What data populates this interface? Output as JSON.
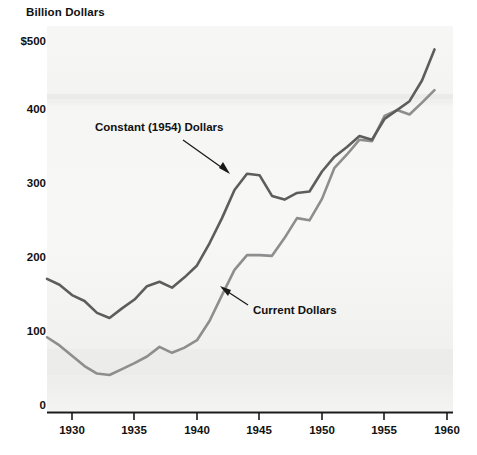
{
  "chart_data": {
    "type": "line",
    "title": "Billion Dollars",
    "xlabel": "",
    "ylabel": "Billion Dollars",
    "xlim": [
      1928,
      1960
    ],
    "ylim": [
      0,
      500
    ],
    "grid": false,
    "legend_position": "inline-annotations",
    "y_ticks": [
      {
        "label": "$500",
        "value": 500
      },
      {
        "label": "400",
        "value": 400
      },
      {
        "label": "300",
        "value": 300
      },
      {
        "label": "200",
        "value": 200
      },
      {
        "label": "100",
        "value": 100
      },
      {
        "label": "0",
        "value": 0
      }
    ],
    "x_ticks": [
      {
        "label": "1930",
        "value": 1930
      },
      {
        "label": "1935",
        "value": 1935
      },
      {
        "label": "1940",
        "value": 1940
      },
      {
        "label": "1945",
        "value": 1945
      },
      {
        "label": "1950",
        "value": 1950
      },
      {
        "label": "1955",
        "value": 1955
      },
      {
        "label": "1960",
        "value": 1960
      }
    ],
    "x": [
      1928,
      1929,
      1930,
      1931,
      1932,
      1933,
      1934,
      1935,
      1936,
      1937,
      1938,
      1939,
      1940,
      1941,
      1942,
      1943,
      1944,
      1945,
      1946,
      1947,
      1948,
      1949,
      1950,
      1951,
      1952,
      1953,
      1954,
      1955,
      1956,
      1957,
      1958,
      1959
    ],
    "series": [
      {
        "name": "Constant (1954) Dollars",
        "color": "#5d5d5d",
        "values": [
          180,
          172,
          158,
          150,
          134,
          127,
          140,
          152,
          170,
          176,
          168,
          182,
          198,
          228,
          262,
          300,
          322,
          320,
          292,
          287,
          296,
          298,
          325,
          345,
          358,
          373,
          368,
          396,
          408,
          420,
          448,
          490
        ]
      },
      {
        "name": "Current Dollars",
        "color": "#8e8e8e",
        "values": [
          101,
          90,
          76,
          62,
          52,
          50,
          58,
          66,
          75,
          88,
          80,
          87,
          97,
          123,
          158,
          192,
          212,
          212,
          211,
          235,
          262,
          259,
          288,
          330,
          348,
          368,
          366,
          400,
          408,
          402,
          418,
          435
        ]
      }
    ],
    "annotations": [
      {
        "text": "Constant (1954) Dollars",
        "target_series": "Constant (1954) Dollars"
      },
      {
        "text": "Current Dollars",
        "target_series": "Current Dollars"
      }
    ]
  }
}
